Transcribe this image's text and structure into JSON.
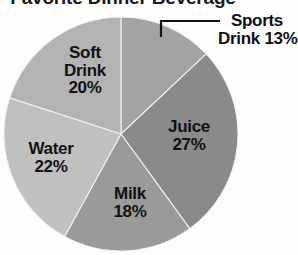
{
  "chart_data": {
    "type": "pie",
    "title": "Favorite Dinner Beverage",
    "xlabel": "",
    "ylabel": "",
    "legend_position": "none",
    "grid": false,
    "value_suffix": "%",
    "start_angle_deg": 0,
    "direction": "clockwise",
    "categories": [
      "Sports Drink",
      "Juice",
      "Milk",
      "Water",
      "Soft Drink"
    ],
    "values": [
      13,
      27,
      18,
      22,
      20
    ],
    "slices": [
      {
        "name": "Sports Drink",
        "value": 13,
        "label_name": "Sports Drink",
        "label_value": "13%",
        "label_placement": "external-callout",
        "color": "#a3a3a3"
      },
      {
        "name": "Juice",
        "value": 27,
        "label_name": "Juice",
        "label_value": "27%",
        "label_placement": "inside",
        "color": "#8a8a8a"
      },
      {
        "name": "Milk",
        "value": 18,
        "label_name": "Milk",
        "label_value": "18%",
        "label_placement": "inside",
        "color": "#9a9a9a"
      },
      {
        "name": "Water",
        "value": 22,
        "label_name": "Water",
        "label_value": "22%",
        "label_placement": "inside",
        "color": "#c0c0c0"
      },
      {
        "name": "Soft Drink",
        "value": 20,
        "label_name": "Soft Drink",
        "label_value": "20%",
        "label_placement": "inside",
        "color": "#b3b3b3"
      }
    ],
    "colors": {
      "sports_drink": "#a3a3a3",
      "juice": "#8a8a8a",
      "milk": "#9a9a9a",
      "water": "#c0c0c0",
      "soft_drink": "#b3b3b3",
      "slice_outline": "#f2f2f2",
      "label_text": "#111111",
      "leader_line": "#101010",
      "background": "#fdfdfd"
    }
  }
}
